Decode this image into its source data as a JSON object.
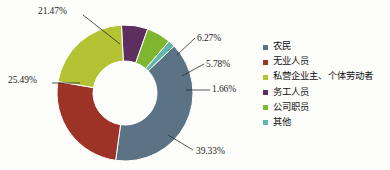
{
  "chart_data": {
    "type": "pie",
    "variant": "donut",
    "title": "",
    "subtitle": "",
    "xlabel": "",
    "ylabel": "",
    "grid": false,
    "legend_position": "right",
    "units": "percent",
    "value_label_suffix": "%",
    "background_color": "#fdfdfb",
    "center": {
      "cx": 125,
      "cy": 93
    },
    "outer_radius": 68,
    "inner_radius": 32,
    "start_angle_deg": -93,
    "categories": [
      "农民",
      "无业人员",
      "私营企业主、个体劳动者",
      "务工人员",
      "公司职员",
      "其他"
    ],
    "values": [
      39.33,
      25.49,
      21.47,
      6.27,
      5.78,
      1.66
    ],
    "value_labels": [
      "39.33%",
      "25.49%",
      "21.47%",
      "6.27%",
      "5.78%",
      "1.66%"
    ],
    "colors": [
      "#5b7384",
      "#9c3326",
      "#b3c334",
      "#5d2f5e",
      "#7fb52f",
      "#63b6ac"
    ],
    "slices": [
      {
        "name": "农民",
        "value": 39.33,
        "label": "39.33%",
        "color": "#5b7384",
        "legend_index": 0,
        "draw_order": 3,
        "label_pos": {
          "x": 196,
          "y": 146
        },
        "leader": {
          "x1": 168,
          "y1": 135,
          "x2": 193,
          "y2": 150
        }
      },
      {
        "name": "无业人员",
        "value": 25.49,
        "label": "25.49%",
        "color": "#9c3326",
        "legend_index": 1,
        "draw_order": 4,
        "label_pos": {
          "x": 8,
          "y": 75
        },
        "leader": {
          "x1": 52,
          "y1": 83,
          "x2": 80,
          "y2": 83
        }
      },
      {
        "name": "私营企业主、个体劳动者",
        "value": 21.47,
        "label": "21.47%",
        "color": "#b3c334",
        "legend_index": 2,
        "draw_order": 5,
        "label_pos": {
          "x": 38,
          "y": 6
        },
        "leader": {
          "x1": 83,
          "y1": 15,
          "x2": 120,
          "y2": 44
        }
      },
      {
        "name": "务工人员",
        "value": 6.27,
        "label": "6.27%",
        "color": "#5d2f5e",
        "legend_index": 3,
        "draw_order": 0,
        "label_pos": {
          "x": 197,
          "y": 33
        },
        "leader": {
          "x1": 177,
          "y1": 55,
          "x2": 195,
          "y2": 38
        }
      },
      {
        "name": "公司职员",
        "value": 5.78,
        "label": "5.78%",
        "color": "#7fb52f",
        "legend_index": 4,
        "draw_order": 1,
        "label_pos": {
          "x": 206,
          "y": 59
        },
        "leader": {
          "x1": 182,
          "y1": 76,
          "x2": 204,
          "y2": 64
        }
      },
      {
        "name": "其他",
        "value": 1.66,
        "label": "1.66%",
        "color": "#63b6ac",
        "legend_index": 5,
        "draw_order": 2,
        "label_pos": {
          "x": 212,
          "y": 84
        },
        "leader": {
          "x1": 186,
          "y1": 90,
          "x2": 210,
          "y2": 90
        }
      }
    ]
  },
  "legend": {
    "items": [
      {
        "label": "农民",
        "color": "#5b7384"
      },
      {
        "label": "无业人员",
        "color": "#9c3326"
      },
      {
        "label": "私营企业主、个体劳动者",
        "color": "#b3c334"
      },
      {
        "label": "务工人员",
        "color": "#5d2f5e"
      },
      {
        "label": "公司职员",
        "color": "#7fb52f"
      },
      {
        "label": "其他",
        "color": "#63b6ac"
      }
    ]
  }
}
